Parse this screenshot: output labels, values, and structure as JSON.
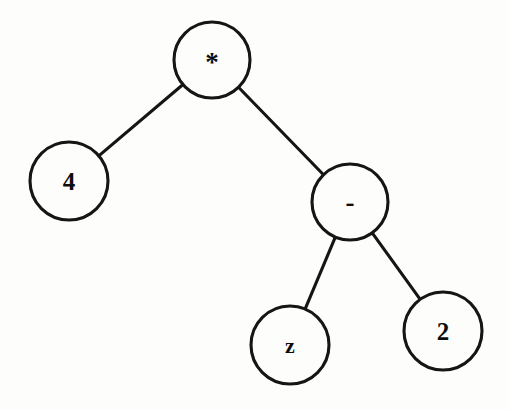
{
  "diagram": {
    "expression": "4 * (z - 2)",
    "background_color": "#fdfdfc",
    "stroke_color": "#151515",
    "label_color": "#0d0d0d",
    "stroke_width": 3.1,
    "width": 508,
    "height": 410
  },
  "nodes": [
    {
      "id": "root",
      "label": "*",
      "role": "operator",
      "cx": 212,
      "cy": 60,
      "r": 38,
      "font_class": "label-star"
    },
    {
      "id": "left",
      "label": "4",
      "role": "operand",
      "cx": 69,
      "cy": 181,
      "r": 39,
      "font_class": "label-digit"
    },
    {
      "id": "right",
      "label": "-",
      "role": "operator",
      "cx": 350,
      "cy": 202,
      "r": 38,
      "font_class": "label-dash"
    },
    {
      "id": "right-left",
      "label": "z",
      "role": "operand",
      "cx": 290,
      "cy": 345,
      "r": 39,
      "font_class": "label-letter"
    },
    {
      "id": "right-right",
      "label": "2",
      "role": "operand",
      "cx": 443,
      "cy": 331,
      "r": 39,
      "font_class": "label-digit"
    }
  ],
  "edges": [
    {
      "id": "edge-root-left",
      "from": "root",
      "to": "left"
    },
    {
      "id": "edge-root-right",
      "from": "root",
      "to": "right"
    },
    {
      "id": "edge-right-rightleft",
      "from": "right",
      "to": "right-left"
    },
    {
      "id": "edge-right-rightright",
      "from": "right",
      "to": "right-right"
    }
  ]
}
